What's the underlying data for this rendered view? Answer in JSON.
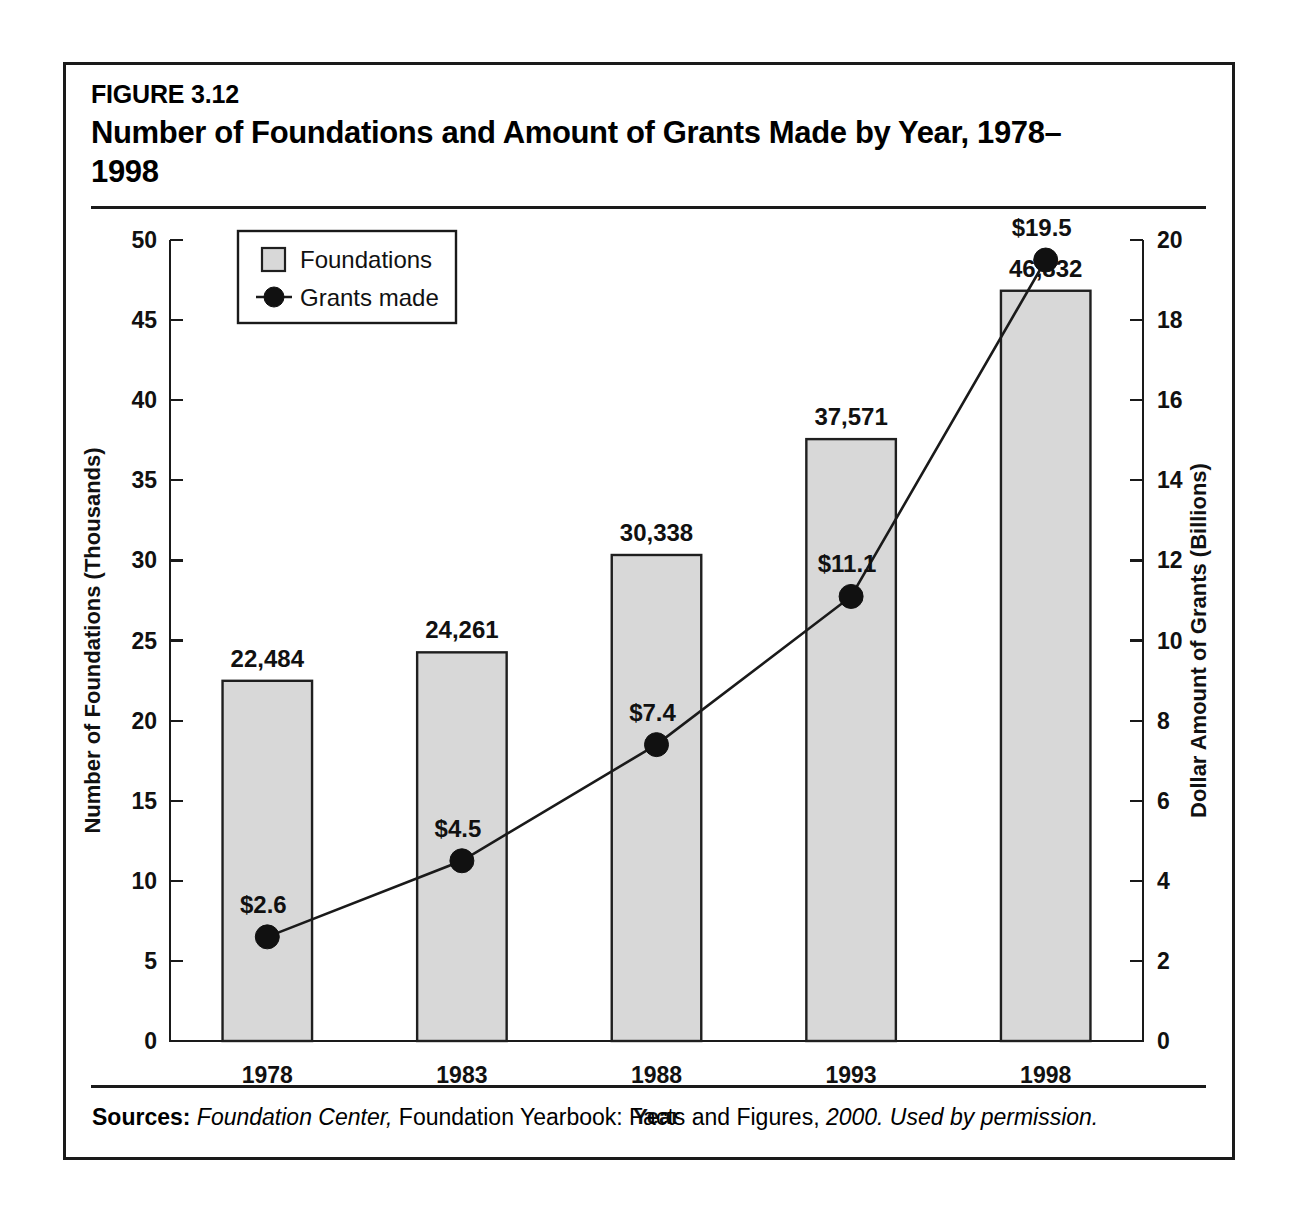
{
  "figure": {
    "number": "FIGURE 3.12",
    "title": "Number of Foundations and Amount of Grants Made by Year, 1978–1998"
  },
  "source": {
    "label": "Sources:",
    "part_italic_1": "Foundation Center,",
    "part_roman": "Foundation Yearbook: Facts and Figures,",
    "part_italic_2": "2000. Used by permission."
  },
  "legend": {
    "bar_label": "Foundations",
    "line_label": "Grants made"
  },
  "colors": {
    "bar_fill": "#d8d8d8",
    "bar_stroke": "#1f1f1f",
    "line": "#1a1a1a",
    "text": "#111111"
  },
  "chart_data": {
    "type": "bar",
    "title": "Number of Foundations and Amount of Grants Made by Year, 1978–1998",
    "xlabel": "Year",
    "ylabel": "Number of Foundations (Thousands)",
    "y2label": "Dollar Amount of Grants (Billions)",
    "categories": [
      "1978",
      "1983",
      "1988",
      "1993",
      "1998"
    ],
    "ylim": [
      0,
      50
    ],
    "y2lim": [
      0,
      20
    ],
    "yticks": [
      0,
      5,
      10,
      15,
      20,
      25,
      30,
      35,
      40,
      45,
      50
    ],
    "y2ticks": [
      0,
      2,
      4,
      6,
      8,
      10,
      12,
      14,
      16,
      18,
      20
    ],
    "grid": false,
    "legend_position": "upper-left-inside",
    "series": [
      {
        "name": "Foundations",
        "type": "bar",
        "axis": "left",
        "unit": "count",
        "values": [
          22484,
          30338,
          30338,
          37571,
          46832
        ],
        "plot_values_thousands": [
          22.484,
          24.261,
          30.338,
          37.571,
          46.832
        ],
        "labels": [
          "22,484",
          "24,261",
          "30,338",
          "37,571",
          "46,832"
        ]
      },
      {
        "name": "Grants made",
        "type": "line",
        "axis": "right",
        "unit": "billions USD",
        "values": [
          2.6,
          4.5,
          7.4,
          11.1,
          19.5
        ],
        "labels": [
          "$2.6",
          "$4.5",
          "$7.4",
          "$11.1",
          "$19.5"
        ]
      }
    ]
  }
}
